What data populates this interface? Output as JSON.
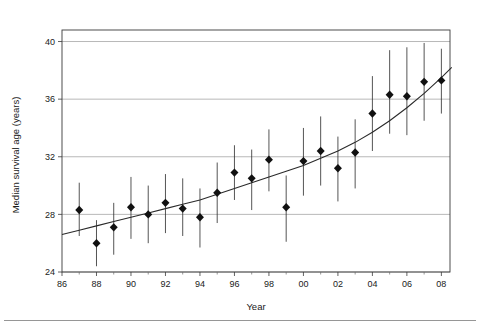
{
  "chart_data": {
    "type": "scatter",
    "title": "",
    "xlabel": "Year",
    "ylabel": "Median survival age (years)",
    "xlim": [
      86,
      108.5
    ],
    "ylim": [
      24,
      40.8
    ],
    "grid": true,
    "legend": null,
    "x_tick_labels": [
      "86",
      "88",
      "90",
      "92",
      "94",
      "96",
      "98",
      "00",
      "02",
      "04",
      "06",
      "08"
    ],
    "x_tick_values": [
      86,
      88,
      90,
      92,
      94,
      96,
      98,
      100,
      102,
      104,
      106,
      108
    ],
    "x_minor_tick_values": [
      87,
      89,
      91,
      93,
      95,
      97,
      99,
      101,
      103,
      105,
      107
    ],
    "y_tick_labels": [
      "24",
      "28",
      "32",
      "36",
      "40"
    ],
    "y_tick_values": [
      24,
      28,
      32,
      36,
      40
    ],
    "marker_style": "filled-diamond",
    "error_bar_style": "vertical-line-no-caps",
    "series": [
      {
        "name": "Median survival age",
        "x": [
          87,
          88,
          89,
          90,
          91,
          92,
          93,
          94,
          95,
          96,
          97,
          98,
          99,
          100,
          101,
          102,
          103,
          104,
          105,
          106,
          107,
          108
        ],
        "values": [
          28.3,
          26.0,
          27.1,
          28.5,
          28.0,
          28.8,
          28.4,
          27.8,
          29.5,
          30.9,
          30.5,
          31.8,
          28.5,
          31.7,
          32.4,
          31.2,
          32.3,
          35.0,
          36.3,
          36.2,
          37.2,
          37.3
        ],
        "y_err_low": [
          26.5,
          24.4,
          25.2,
          26.3,
          26.0,
          26.7,
          26.5,
          25.7,
          27.4,
          29.0,
          28.3,
          29.6,
          26.1,
          29.3,
          30.0,
          28.9,
          29.8,
          32.4,
          33.6,
          33.5,
          34.5,
          35.0
        ],
        "y_err_high": [
          30.2,
          27.6,
          28.8,
          30.6,
          30.0,
          30.8,
          30.5,
          29.8,
          31.6,
          32.8,
          32.5,
          33.9,
          30.7,
          34.0,
          34.8,
          33.4,
          34.6,
          37.6,
          39.4,
          39.6,
          39.9,
          39.5
        ]
      }
    ],
    "fit_curve": {
      "name": "fitted trend",
      "x": [
        86,
        87,
        88,
        89,
        90,
        91,
        92,
        93,
        94,
        95,
        96,
        97,
        98,
        99,
        100,
        101,
        102,
        103,
        104,
        105,
        106,
        107,
        108,
        108.6
      ],
      "values": [
        26.6,
        26.9,
        27.2,
        27.5,
        27.8,
        28.1,
        28.4,
        28.7,
        29.0,
        29.4,
        29.8,
        30.2,
        30.6,
        31.0,
        31.4,
        31.9,
        32.4,
        33.0,
        33.7,
        34.5,
        35.4,
        36.4,
        37.5,
        38.2
      ]
    }
  },
  "colors": {
    "marker": "#111111",
    "errorbar": "#2a2a2a",
    "fitline": "#2a2a2a",
    "gridline": "#9a9a9a",
    "frame": "#3a3a3a",
    "text": "#1a1a1a",
    "background": "#ffffff"
  }
}
